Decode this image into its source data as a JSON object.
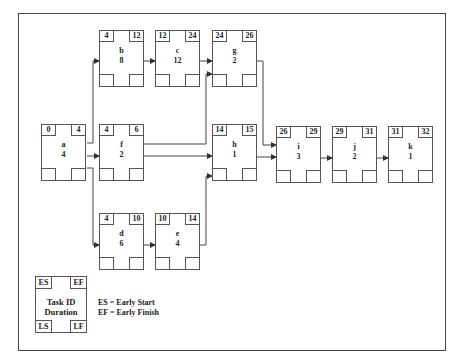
{
  "diagram": {
    "type": "network-diagram",
    "nodes": [
      {
        "id": "a",
        "duration": "4",
        "es": "0",
        "ef": "4"
      },
      {
        "id": "b",
        "duration": "8",
        "es": "4",
        "ef": "12"
      },
      {
        "id": "c",
        "duration": "12",
        "es": "12",
        "ef": "24"
      },
      {
        "id": "g",
        "duration": "2",
        "es": "24",
        "ef": "26"
      },
      {
        "id": "f",
        "duration": "2",
        "es": "4",
        "ef": "6"
      },
      {
        "id": "h",
        "duration": "1",
        "es": "14",
        "ef": "15"
      },
      {
        "id": "d",
        "duration": "6",
        "es": "4",
        "ef": "10"
      },
      {
        "id": "e",
        "duration": "4",
        "es": "10",
        "ef": "14"
      },
      {
        "id": "i",
        "duration": "3",
        "es": "26",
        "ef": "29"
      },
      {
        "id": "j",
        "duration": "2",
        "es": "29",
        "ef": "31"
      },
      {
        "id": "k",
        "duration": "1",
        "es": "31",
        "ef": "32"
      }
    ],
    "edges": [
      [
        "a",
        "b"
      ],
      [
        "a",
        "f"
      ],
      [
        "a",
        "d"
      ],
      [
        "b",
        "c"
      ],
      [
        "c",
        "g"
      ],
      [
        "f",
        "g"
      ],
      [
        "f",
        "h"
      ],
      [
        "d",
        "e"
      ],
      [
        "e",
        "h"
      ],
      [
        "g",
        "i"
      ],
      [
        "h",
        "i"
      ],
      [
        "i",
        "j"
      ],
      [
        "j",
        "k"
      ]
    ]
  },
  "legend": {
    "es": "ES",
    "ef": "EF",
    "ls": "LS",
    "lf": "LF",
    "task_id": "Task ID",
    "duration": "Duration",
    "key_es": "ES = Early Start",
    "key_ef": "EF = Early Finish"
  }
}
